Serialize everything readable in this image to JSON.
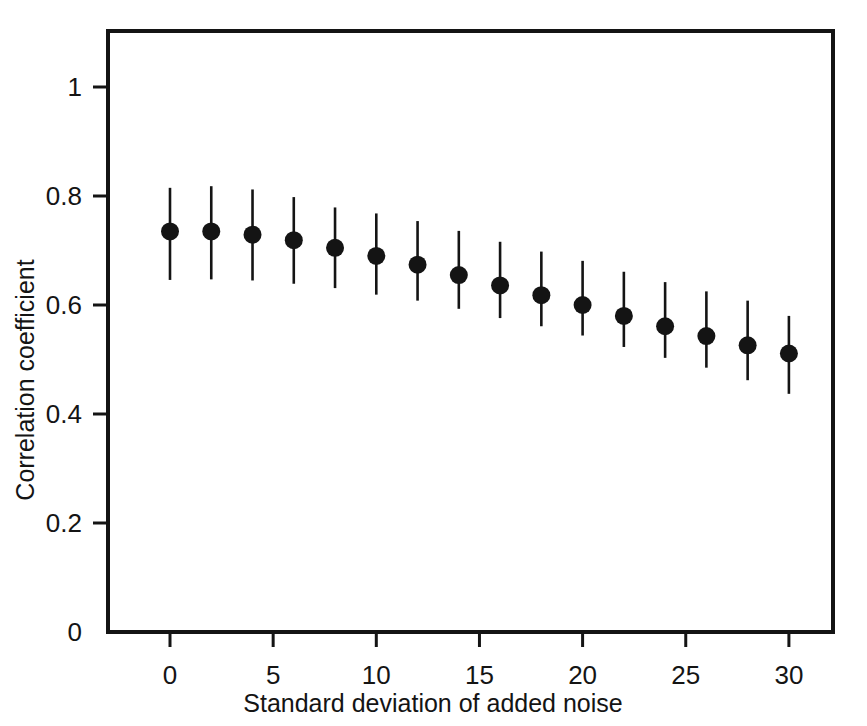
{
  "chart_data": {
    "type": "scatter",
    "title": "",
    "subtitle": "",
    "xlabel": "Standard deviation of added noise",
    "ylabel": "Correlation coefficient",
    "xlim": [
      -2.2,
      33.0
    ],
    "ylim": [
      0.0,
      1.105
    ],
    "grid": false,
    "legend": null,
    "error_bars": "vertical",
    "x_ticks": [
      0,
      5,
      10,
      15,
      20,
      25,
      30
    ],
    "x_tick_labels": [
      "0",
      "5",
      "10",
      "15",
      "20",
      "25",
      "30"
    ],
    "y_ticks": [
      0,
      0.2,
      0.4,
      0.6,
      0.8,
      1
    ],
    "y_tick_labels": [
      "0",
      "0.2",
      "0.4",
      "0.6",
      "0.8",
      "1"
    ],
    "x": [
      0,
      2,
      4,
      6,
      8,
      10,
      12,
      14,
      16,
      18,
      20,
      22,
      24,
      26,
      28,
      30
    ],
    "y": [
      0.735,
      0.735,
      0.729,
      0.719,
      0.705,
      0.69,
      0.674,
      0.655,
      0.636,
      0.618,
      0.6,
      0.58,
      0.561,
      0.543,
      0.526,
      0.511
    ],
    "y_upper": [
      0.815,
      0.818,
      0.812,
      0.798,
      0.779,
      0.768,
      0.754,
      0.736,
      0.716,
      0.698,
      0.681,
      0.661,
      0.642,
      0.625,
      0.608,
      0.58
    ],
    "y_lower": [
      0.646,
      0.647,
      0.645,
      0.639,
      0.631,
      0.619,
      0.608,
      0.593,
      0.576,
      0.561,
      0.544,
      0.523,
      0.503,
      0.485,
      0.462,
      0.437
    ],
    "series": [
      {
        "name": "Correlation coefficient vs noise",
        "marker": "filled-circle",
        "color": "#141414",
        "values": [
          0.735,
          0.735,
          0.729,
          0.719,
          0.705,
          0.69,
          0.674,
          0.655,
          0.636,
          0.618,
          0.6,
          0.58,
          0.561,
          0.543,
          0.526,
          0.511
        ]
      }
    ]
  },
  "figure": {
    "background_color": "#ffffff",
    "axis_color": "#141414",
    "marker_color": "#141414"
  }
}
